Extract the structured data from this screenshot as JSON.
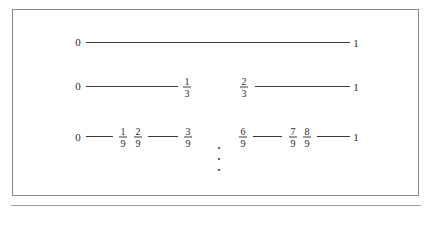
{
  "figure": {
    "rows": [
      {
        "level": 0,
        "labels": [
          {
            "text": "0"
          },
          {
            "text": "1"
          }
        ],
        "intervals": [
          [
            "0",
            "1"
          ]
        ]
      },
      {
        "level": 1,
        "labels": [
          {
            "text": "0"
          },
          {
            "num": "1",
            "den": "3"
          },
          {
            "num": "2",
            "den": "3"
          },
          {
            "text": "1"
          }
        ],
        "intervals": [
          [
            "0",
            "1/3"
          ],
          [
            "2/3",
            "1"
          ]
        ]
      },
      {
        "level": 2,
        "labels": [
          {
            "text": "0"
          },
          {
            "num": "1",
            "den": "9"
          },
          {
            "num": "2",
            "den": "9"
          },
          {
            "num": "3",
            "den": "9"
          },
          {
            "num": "6",
            "den": "9"
          },
          {
            "num": "7",
            "den": "9"
          },
          {
            "num": "8",
            "den": "9"
          },
          {
            "text": "1"
          }
        ],
        "intervals": [
          [
            "0",
            "1/9"
          ],
          [
            "2/9",
            "3/9"
          ],
          [
            "6/9",
            "7/9"
          ],
          [
            "8/9",
            "1"
          ]
        ]
      }
    ],
    "continuation": "vertical-ellipsis"
  }
}
